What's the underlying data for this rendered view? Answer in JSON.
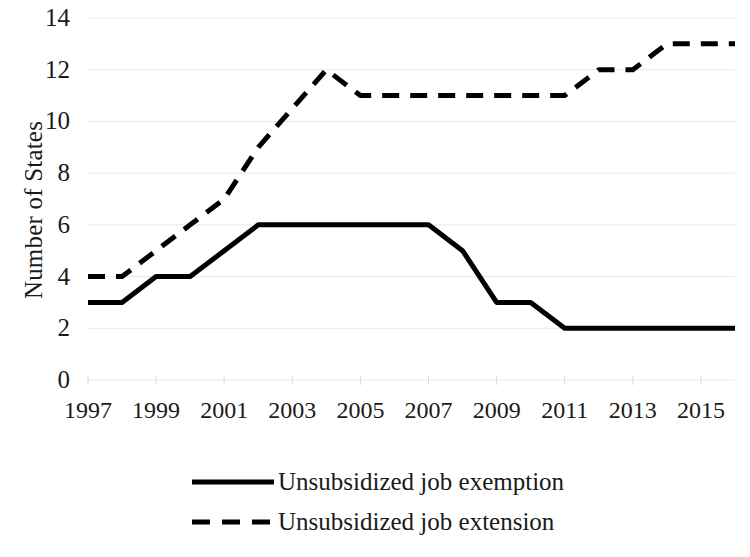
{
  "chart_data": {
    "type": "line",
    "title": "",
    "xlabel": "",
    "ylabel": "Number of States",
    "xlim": [
      1997,
      2016
    ],
    "ylim": [
      0,
      14
    ],
    "ytick_labels": [
      "14",
      "12",
      "10",
      "8",
      "6",
      "4",
      "2",
      "0"
    ],
    "ytick_values": [
      14,
      12,
      10,
      8,
      6,
      4,
      2,
      0
    ],
    "xtick_labels": [
      "1997",
      "1999",
      "2001",
      "2003",
      "2005",
      "2007",
      "2009",
      "2011",
      "2013",
      "2015"
    ],
    "xtick_values": [
      1997,
      1999,
      2001,
      2003,
      2005,
      2007,
      2009,
      2011,
      2013,
      2015
    ],
    "grid": true,
    "grid_axis": "y",
    "legend_position": "bottom",
    "x": [
      1997,
      1998,
      1999,
      2000,
      2001,
      2002,
      2003,
      2004,
      2005,
      2006,
      2007,
      2008,
      2009,
      2010,
      2011,
      2012,
      2013,
      2014,
      2015,
      2016
    ],
    "series": [
      {
        "name": "Unsubsidized job exemption",
        "style": "solid",
        "color": "#000000",
        "values": [
          3,
          3,
          4,
          4,
          5,
          6,
          6,
          6,
          6,
          6,
          6,
          5,
          3,
          3,
          2,
          2,
          2,
          2,
          2,
          2
        ]
      },
      {
        "name": "Unsubsidized job extension",
        "style": "dashed",
        "color": "#000000",
        "values": [
          4,
          4,
          5,
          6,
          7,
          9,
          10.5,
          12,
          11,
          11,
          11,
          11,
          11,
          11,
          11,
          12,
          12,
          13,
          13,
          13
        ]
      }
    ]
  },
  "legend": {
    "items": [
      {
        "label": "Unsubsidized job exemption",
        "style": "solid"
      },
      {
        "label": "Unsubsidized job extension",
        "style": "dashed"
      }
    ]
  }
}
